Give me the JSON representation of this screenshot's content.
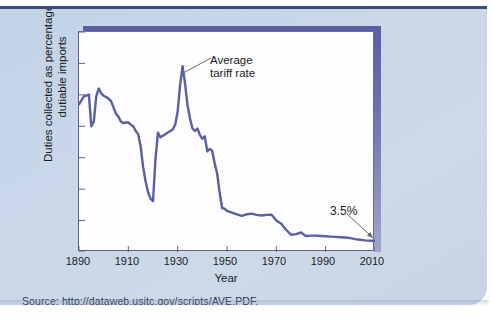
{
  "figure": {
    "source_note": "Source: http://dataweb.usitc.gov/scripts/AVE.PDF.",
    "accent_color": "#5b5ea3",
    "panel_color": "#c7d5e8",
    "rule_color": "#3a4a7c"
  },
  "chart_data": {
    "type": "line",
    "title": "",
    "xlabel": "Year",
    "ylabel": "Duties collected as percentage of dutiable imports",
    "xlim": [
      1890,
      2010
    ],
    "ylim": [
      0,
      70
    ],
    "xticks": [
      1890,
      1910,
      1930,
      1950,
      1970,
      1990,
      2010
    ],
    "yticks": [
      0,
      10,
      20,
      30,
      40,
      50,
      60,
      70
    ],
    "grid": false,
    "legend": "none",
    "series": [
      {
        "name": "Average tariff rate",
        "color": "#5b5ea3",
        "x": [
          1890,
          1892,
          1894,
          1895,
          1896,
          1897,
          1898,
          1899,
          1900,
          1901,
          1902,
          1903,
          1904,
          1905,
          1906,
          1907,
          1908,
          1909,
          1910,
          1911,
          1912,
          1913,
          1914,
          1915,
          1916,
          1917,
          1918,
          1919,
          1920,
          1921,
          1922,
          1923,
          1924,
          1925,
          1926,
          1927,
          1928,
          1929,
          1930,
          1931,
          1932,
          1933,
          1934,
          1935,
          1936,
          1937,
          1938,
          1939,
          1940,
          1941,
          1942,
          1943,
          1944,
          1945,
          1946,
          1947,
          1948,
          1949,
          1950,
          1952,
          1954,
          1956,
          1958,
          1960,
          1962,
          1964,
          1966,
          1968,
          1970,
          1972,
          1974,
          1976,
          1978,
          1980,
          1982,
          1984,
          1986,
          1988,
          1990,
          1992,
          1994,
          1996,
          1998,
          2000,
          2002,
          2004,
          2006,
          2008,
          2010
        ],
        "y": [
          47.0,
          49.5,
          50.1,
          40.0,
          41.5,
          49.5,
          52.0,
          50.5,
          49.7,
          49.3,
          48.8,
          48.0,
          46.0,
          44.0,
          43.0,
          41.5,
          41.0,
          41.2,
          41.2,
          40.5,
          40.0,
          38.5,
          37.5,
          33.5,
          27.0,
          22.5,
          19.0,
          17.0,
          16.2,
          29.5,
          38.0,
          36.5,
          37.0,
          37.5,
          38.0,
          38.5,
          39.0,
          40.5,
          44.7,
          53.2,
          59.1,
          53.5,
          46.7,
          42.5,
          39.3,
          38.5,
          39.3,
          37.3,
          36.0,
          36.8,
          32.0,
          32.8,
          32.2,
          28.2,
          25.0,
          19.0,
          14.0,
          13.8,
          13.1,
          12.5,
          12.0,
          11.5,
          12.0,
          12.2,
          11.8,
          11.6,
          11.8,
          11.9,
          10.0,
          9.0,
          7.0,
          5.5,
          5.7,
          6.2,
          5.1,
          5.2,
          5.2,
          5.1,
          5.0,
          4.9,
          4.8,
          4.7,
          4.6,
          4.4,
          4.1,
          3.9,
          3.7,
          3.6,
          3.5
        ]
      }
    ],
    "annotations": [
      {
        "id": "avg-tariff",
        "text": "Average\ntariff rate",
        "points_to_x": 1932,
        "points_to_y": 59.1
      },
      {
        "id": "final-value",
        "text": "3.5%",
        "points_to_x": 2010,
        "points_to_y": 3.5
      }
    ]
  }
}
